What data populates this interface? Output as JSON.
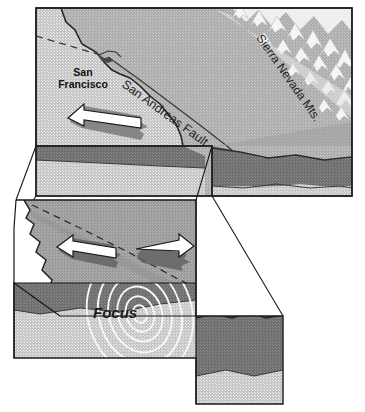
{
  "figure": {
    "type": "geologic-block-diagram"
  },
  "labels": {
    "city": "San\nFrancisco",
    "city_line1": "San",
    "city_line2": "Francisco",
    "fault": "San Andreas Fault",
    "mountains": "Sierra Nevada Mts.",
    "focus": "Focus"
  },
  "colors": {
    "outline": "#1a1a1a",
    "land_surface": "#a8a8a8",
    "land_surface_light": "#c2c2c2",
    "ocean": "#bdbdbd",
    "upper_rock": "#6e6e6e",
    "lower_rock": "#c9c9c9",
    "mid_rock": "#8a8a8a",
    "snow": "#f2f2f2",
    "arrow_fill": "#ffffff",
    "arrow_shadow": "#6e6e6e",
    "wave": "#f5f5f5",
    "background": "#ffffff"
  },
  "elements": {
    "top_block_name": "regional-block-diagram",
    "bottom_block_name": "focus-block-diagram",
    "inset_box_name": "inset-selection-box",
    "arrows_top": 1,
    "arrows_bottom": 2,
    "wave_rings": 6
  }
}
